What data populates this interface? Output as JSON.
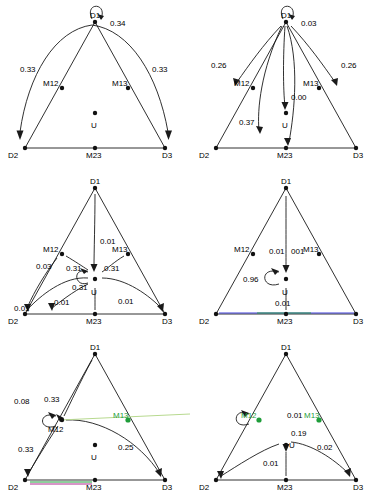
{
  "figure": {
    "caption": "",
    "colors": {
      "line": "#1a1a1a",
      "node": "#111111",
      "green": "#1f9d3a",
      "magenta": "#b02a8f",
      "blue": "#2b2bd6"
    }
  },
  "panels": [
    {
      "id": "panel-1",
      "vertices": {
        "top": "D1",
        "left": "D2",
        "right": "D3"
      },
      "mid_labels": {
        "left": "M12",
        "right": "M13",
        "bottom": "M23"
      },
      "center_label": "U",
      "edge_values": [
        "0.34",
        "0.33",
        "0.33"
      ],
      "self_loop_value": "0.34"
    },
    {
      "id": "panel-2",
      "vertices": {
        "top": "D1",
        "left": "D2",
        "right": "D3"
      },
      "mid_labels": {
        "left": "M12",
        "right": "M13",
        "bottom": "M23"
      },
      "center_label": "U",
      "edge_values": [
        "0.03",
        "0.26",
        "0.26",
        "0.00",
        "0.37"
      ],
      "self_loop_value": "0.03"
    },
    {
      "id": "panel-3",
      "vertices": {
        "top": "D1",
        "left": "D2",
        "right": "D3"
      },
      "mid_labels": {
        "left": "M12",
        "right": "M13",
        "bottom": "M23"
      },
      "center_label": "U",
      "edge_values": [
        "0.01",
        "0.31",
        "0.31",
        "0.03",
        "0.31",
        "0.01",
        "0.01",
        "0.01"
      ],
      "self_loop_value": "0.31"
    },
    {
      "id": "panel-4",
      "vertices": {
        "top": "D1",
        "left": "D2",
        "right": "D3"
      },
      "mid_labels": {
        "left": "M12",
        "right": "M13",
        "bottom": "M23"
      },
      "center_label": "U",
      "edge_values": [
        "0.01",
        "001",
        "0.96",
        "0.01"
      ],
      "self_loop_value": "0.96"
    },
    {
      "id": "panel-5",
      "vertices": {
        "top": "D1",
        "left": "D2",
        "right": "D3"
      },
      "mid_labels": {
        "left": "M12",
        "right": "M13",
        "bottom": "M23"
      },
      "center_label": "U",
      "edge_values": [
        "0.08",
        "0.33",
        "0.33",
        "0.25"
      ],
      "self_loop_value": "0.33"
    },
    {
      "id": "panel-6",
      "vertices": {
        "top": "D1",
        "left": "D2",
        "right": "D3"
      },
      "mid_labels": {
        "left": "M12",
        "right": "M13",
        "bottom": "M23"
      },
      "center_label": "U",
      "edge_values": [
        "0.01",
        "0.19",
        "0.02",
        "0.01"
      ],
      "self_loop_value": ""
    }
  ]
}
